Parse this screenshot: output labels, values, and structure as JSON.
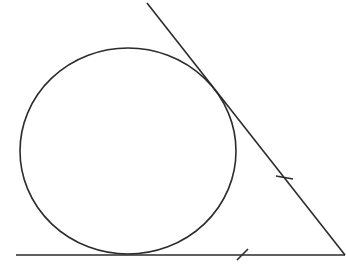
{
  "diagram": {
    "stroke_color": "#2b2b2b",
    "background": "#ffffff",
    "circle": {
      "cx": 128,
      "cy": 151,
      "rx": 108,
      "ry": 103
    },
    "baseline": {
      "x1": 16,
      "y1": 255,
      "x2": 345,
      "y2": 255
    },
    "slant_line": {
      "x1": 147,
      "y1": 3,
      "x2": 345,
      "y2": 255
    },
    "tick_marks": [
      {
        "on": "slant_line",
        "x1": 276,
        "y1": 176,
        "x2": 293,
        "y2": 179
      },
      {
        "on": "baseline",
        "x1": 237,
        "y1": 260,
        "x2": 248,
        "y2": 249
      }
    ]
  }
}
